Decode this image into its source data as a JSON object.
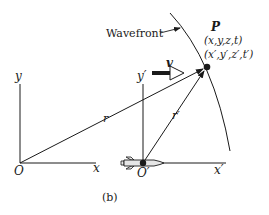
{
  "figure": {
    "caption": "(b)",
    "labels": {
      "wavefront": "Wavefront",
      "point": "P",
      "coords_unprimed": "(x,y,z,t)",
      "coords_primed": "(x′,y′,z′,t′)",
      "velocity": "v",
      "y_axis": "y",
      "x_axis": "x",
      "origin": "O",
      "y_axis_primed": "y′",
      "x_axis_primed": "x′",
      "origin_primed": "O′",
      "r_vector": "r",
      "r_vector_primed": "r′"
    },
    "colors": {
      "ink": "#1a1a1a",
      "rocket_fill": "#e6e6e6",
      "background": "#ffffff"
    }
  }
}
